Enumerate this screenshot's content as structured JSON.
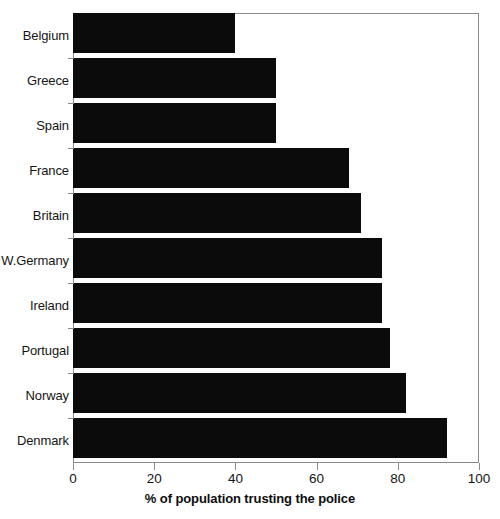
{
  "chart_data": {
    "type": "bar",
    "orientation": "horizontal",
    "title": "",
    "xlabel": "% of population trusting the police",
    "ylabel": "",
    "xlim": [
      0,
      100
    ],
    "xticks": [
      0,
      20,
      40,
      60,
      80,
      100
    ],
    "xtick_labels": [
      "0",
      "20",
      "40",
      "60",
      "80",
      "100"
    ],
    "grid": false,
    "legend": false,
    "bar_color": "#0b0b0b",
    "frame_color": "#8a8a8a",
    "categories": [
      "Belgium",
      "Greece",
      "Spain",
      "France",
      "Britain",
      "W.Germany",
      "Ireland",
      "Portugal",
      "Norway",
      "Denmark"
    ],
    "values": [
      40,
      50,
      50,
      68,
      71,
      76,
      76,
      78,
      82,
      92
    ],
    "bars": [
      {
        "category": "Belgium",
        "value": 40
      },
      {
        "category": "Greece",
        "value": 50
      },
      {
        "category": "Spain",
        "value": 50
      },
      {
        "category": "France",
        "value": 68
      },
      {
        "category": "Britain",
        "value": 71
      },
      {
        "category": "W.Germany",
        "value": 76
      },
      {
        "category": "Ireland",
        "value": 76
      },
      {
        "category": "Portugal",
        "value": 78
      },
      {
        "category": "Norway",
        "value": 82
      },
      {
        "category": "Denmark",
        "value": 92
      }
    ]
  }
}
